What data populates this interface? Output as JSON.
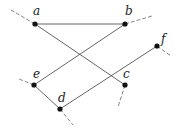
{
  "diagram": {
    "type": "graph",
    "nodes": [
      {
        "id": "a",
        "label": "a",
        "x": 35,
        "y": 24,
        "lx": 33,
        "ly": 15
      },
      {
        "id": "b",
        "label": "b",
        "x": 125,
        "y": 24,
        "lx": 125,
        "ly": 15
      },
      {
        "id": "f",
        "label": "f",
        "x": 157,
        "y": 46,
        "lx": 161,
        "ly": 43
      },
      {
        "id": "e",
        "label": "e",
        "x": 34,
        "y": 85,
        "lx": 33,
        "ly": 78
      },
      {
        "id": "c",
        "label": "c",
        "x": 125,
        "y": 85,
        "lx": 123,
        "ly": 78
      },
      {
        "id": "d",
        "label": "d",
        "x": 60,
        "y": 109,
        "lx": 58,
        "ly": 102
      }
    ],
    "edges": [
      {
        "from": "a",
        "to": "b"
      },
      {
        "from": "a",
        "to": "c"
      },
      {
        "from": "b",
        "to": "e"
      },
      {
        "from": "e",
        "to": "d"
      },
      {
        "from": "d",
        "to": "f"
      }
    ],
    "stubs": [
      {
        "node": "a",
        "x2": 11,
        "y2": 10
      },
      {
        "node": "b",
        "x2": 152,
        "y2": 16
      },
      {
        "node": "f",
        "x2": 171,
        "y2": 56
      },
      {
        "node": "e",
        "x2": 19,
        "y2": 79
      },
      {
        "node": "c",
        "x2": 118,
        "y2": 107
      },
      {
        "node": "d",
        "x2": 73,
        "y2": 125
      }
    ]
  }
}
